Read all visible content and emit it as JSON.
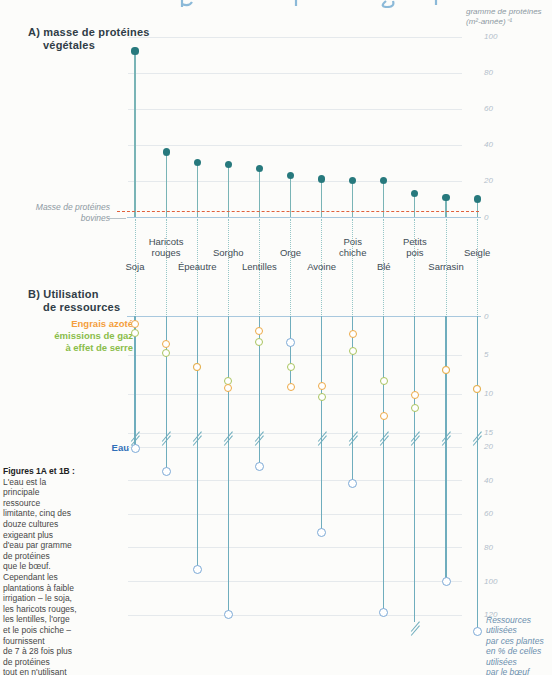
{
  "colors": {
    "teal_dot": "#27797d",
    "teal_stem": "#79b4b6",
    "teal_dotted": "#95c6c7",
    "column_line": "#6fadbd",
    "axis_line": "#a8c8de",
    "grid": "#e5e9ec",
    "tick": "#b3c0cb",
    "red_ref": "#e0603c",
    "orange": "#eda945",
    "orange_text": "#f49f3d",
    "green": "#a9c45d",
    "green_text": "#8abd4a",
    "blue_circle": "#7ca9d6",
    "blue_text": "#2f6fb8",
    "title": "#303d47",
    "label": "#3e4c55",
    "muted": "#8d99a2",
    "pointer": "#b9c2c8",
    "note_blue": "#6b8fae"
  },
  "header": {
    "unit_label": "gramme de protéines\n(m²-année)⁻¹"
  },
  "panelA": {
    "title1": "A) masse de protéines",
    "title2": "végétales",
    "reference_label": "Masse de protéines\nbovines"
  },
  "panelB": {
    "title1": "B) Utilisation",
    "title2": "de ressources",
    "legend": {
      "engrais": "Engrais azoté",
      "gaz": "émissions de gaz\nà effet de serre",
      "eau": "Eau"
    },
    "note": "Ressources\nutilisées\npar ces plantes\nen % de celles\nutilisées\npar le bœuf"
  },
  "caption": {
    "title": "Figures 1A et 1B :",
    "body": "L'eau est la\nprincipale\nressource\nlimitante, cinq des\ndouze cultures\nexigeant plus\nd'eau par gramme\nde protéines\nque le bœuf.\nCependant les\nplantations à faible\nirrigation – le soja,\nles haricots rouges,\nles lentilles, l'orge\net le pois chiche –\nfournissent\nde 7 à 28 fois plus\nde protéines\ntout en n'utilisant"
  },
  "chart_data": [
    {
      "type": "scatter",
      "panel": "A",
      "title": "A) masse de protéines végétales",
      "ylabel": "gramme de protéines (m²-année)⁻¹",
      "categories": [
        "Soja",
        "Haricots rouges",
        "Épeautre",
        "Sorgho",
        "Lentilles",
        "Orge",
        "Avoine",
        "Pois chiche",
        "Blé",
        "Petits pois",
        "Sarrasin",
        "Seigle"
      ],
      "values": [
        92,
        36,
        30,
        29,
        27,
        23,
        21,
        20,
        20,
        13,
        11,
        10
      ],
      "ylim": [
        0,
        100
      ],
      "yticks": [
        0,
        20,
        40,
        60,
        80,
        100
      ],
      "grid": true,
      "reference_line": {
        "label": "Masse de protéines bovines",
        "value": 3.5
      },
      "label_lines": [
        [
          "Soja"
        ],
        [
          "Haricots",
          "rouges"
        ],
        [
          "Épeautre"
        ],
        [
          "Sorgho"
        ],
        [
          "Lentilles"
        ],
        [
          "Orge"
        ],
        [
          "Avoine"
        ],
        [
          "Pois",
          "chiche"
        ],
        [
          "Blé"
        ],
        [
          "Petits",
          "pois"
        ],
        [
          "Sarrasin"
        ],
        [
          "Seigle"
        ]
      ],
      "label_rows": [
        "lower",
        "upper",
        "lower",
        "upper",
        "lower",
        "upper",
        "lower",
        "upper",
        "lower",
        "upper",
        "lower",
        "upper"
      ]
    },
    {
      "type": "scatter",
      "panel": "B",
      "title": "B) Utilisation de ressources",
      "ylabel": "Ressources utilisées par ces plantes en % de celles utilisées par le bœuf",
      "categories": [
        "Soja",
        "Haricots rouges",
        "Épeautre",
        "Sorgho",
        "Lentilles",
        "Orge",
        "Avoine",
        "Pois chiche",
        "Blé",
        "Petits pois",
        "Sarrasin",
        "Seigle"
      ],
      "yticks": [
        0,
        5,
        10,
        15,
        20,
        40,
        60,
        80,
        100,
        120
      ],
      "axis_direction": "down",
      "axis_break_between": [
        15,
        20
      ],
      "series": [
        {
          "name": "Engrais azoté",
          "color": "#eda945",
          "values": [
            1,
            3.6,
            6.6,
            9.2,
            1.9,
            9.1,
            9,
            2.3,
            12.8,
            10.2,
            6.9,
            9.4
          ]
        },
        {
          "name": "émissions de gaz à effet de serre",
          "color": "#a9c45d",
          "values": [
            2.2,
            4.7,
            6.6,
            8.3,
            3.3,
            6.6,
            10.4,
            4.5,
            8.3,
            11.8,
            6.9,
            9.4
          ]
        },
        {
          "name": "Eau",
          "color": "#7ca9d6",
          "values": [
            21,
            35,
            93,
            120,
            32,
            3.4,
            71,
            42,
            119,
            null,
            100,
            130
          ],
          "offscale_index": 9
        }
      ]
    }
  ]
}
